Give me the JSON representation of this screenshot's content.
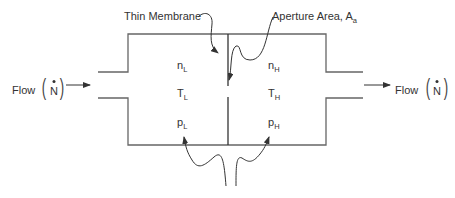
{
  "diagram": {
    "labels": {
      "thin_membrane": "Thin Membrane",
      "aperture_area": "Aperture Area, A",
      "aperture_sub": "a",
      "flow_in": "Flow",
      "flow_out": "Flow",
      "flow_symbol": "N"
    },
    "left_chamber": {
      "n": "n",
      "n_sub": "L",
      "T": "T",
      "T_sub": "L",
      "p": "p",
      "p_sub": "L"
    },
    "right_chamber": {
      "n": "n",
      "n_sub": "H",
      "T": "T",
      "T_sub": "H",
      "p": "p",
      "p_sub": "H"
    },
    "colors": {
      "stroke": "#555555",
      "text": "#333333",
      "background": "#ffffff"
    }
  }
}
